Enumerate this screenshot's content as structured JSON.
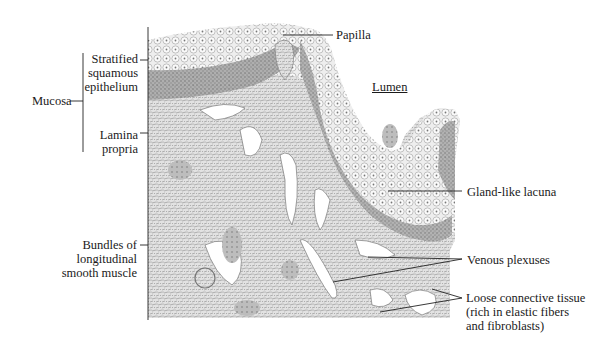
{
  "figure": {
    "colors": {
      "background": "#ffffff",
      "leader_line": "#222222",
      "epithelium_light": "#e9e9e9",
      "epithelium_basal": "#9a9a9a",
      "connective": "#d4d4d4",
      "lumen": "#ffffff"
    }
  },
  "labels": {
    "mucosa": "Mucosa",
    "stratified": [
      "Stratified",
      "squamous",
      "epithelium"
    ],
    "lamina": [
      "Lamina",
      "propria"
    ],
    "muscle": [
      "Bundles of",
      "longitudinal",
      "smooth muscle"
    ],
    "papilla": "Papilla",
    "lumen": "Lumen",
    "gland": "Gland-like lacuna",
    "venous": "Venous plexuses",
    "loose": [
      "Loose connective tissue",
      "(rich in elastic fibers",
      "and fibroblasts)"
    ]
  }
}
